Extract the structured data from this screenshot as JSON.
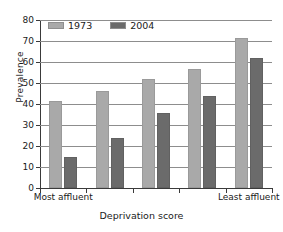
{
  "chart_data": {
    "type": "bar",
    "title": "",
    "xlabel": "Deprivation score",
    "ylabel": "Prevalence",
    "categories": [
      "Most affluent",
      "",
      "",
      "",
      "Least affluent"
    ],
    "series": [
      {
        "name": "1973",
        "color": "#a9a9a9",
        "values": [
          41.5,
          46,
          52,
          56.5,
          71.5
        ]
      },
      {
        "name": "2004",
        "color": "#6b6b6b",
        "values": [
          15,
          24,
          35.5,
          44,
          62
        ]
      }
    ],
    "ylim": [
      0,
      80
    ],
    "yticks": [
      0,
      10,
      20,
      30,
      40,
      50,
      60,
      70,
      80
    ],
    "ytick_labels": [
      "0",
      "10",
      "20",
      "30",
      "40",
      "50",
      "60",
      "70",
      "80"
    ],
    "grid": true,
    "legend_position": "top-left",
    "legend": [
      {
        "label": "1973",
        "color": "#a9a9a9"
      },
      {
        "label": "2004",
        "color": "#6b6b6b"
      }
    ]
  },
  "axes": {
    "y_title": "Prevalence",
    "x_title": "Deprivation score",
    "x_left_label": "Most affluent",
    "x_right_label": "Least affluent"
  }
}
